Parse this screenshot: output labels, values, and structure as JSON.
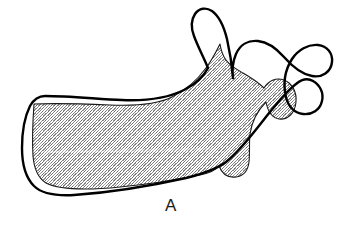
{
  "figure": {
    "panel_label": "A",
    "caption_text": "A",
    "background_color": "#ffffff",
    "outline_color": "#000000",
    "stipple_fill_color": "#b8b8b8",
    "stipple_dot_color": "#767676",
    "stipple_edge_color": "#1a1a1a",
    "view": "lateral-oblique",
    "overlay_description": "two superimposed mandible outlines",
    "shapes": [
      {
        "name": "adult-mandible-outline",
        "style": "bold-black-outline",
        "fill": "none",
        "stroke": "#000000",
        "stroke_width": 2.4
      },
      {
        "name": "infant-mandible-stippled",
        "style": "stippled-gray-fill",
        "fill": "#b8b8b8",
        "stroke": "#1a1a1a",
        "stroke_width": 1.1
      }
    ],
    "landmarks": [
      {
        "name": "coronoid-process",
        "x": 228,
        "y": 12
      },
      {
        "name": "sigmoid-notch",
        "x": 262,
        "y": 58
      },
      {
        "name": "condylar-process",
        "x": 305,
        "y": 42
      },
      {
        "name": "ramus",
        "x": 265,
        "y": 110
      },
      {
        "name": "angle-of-mandible",
        "x": 232,
        "y": 168
      },
      {
        "name": "body-of-mandible",
        "x": 130,
        "y": 140
      },
      {
        "name": "mental-symphysis",
        "x": 30,
        "y": 140
      },
      {
        "name": "alveolar-ridge",
        "x": 110,
        "y": 98
      },
      {
        "name": "inferior-border",
        "x": 120,
        "y": 186
      }
    ]
  }
}
